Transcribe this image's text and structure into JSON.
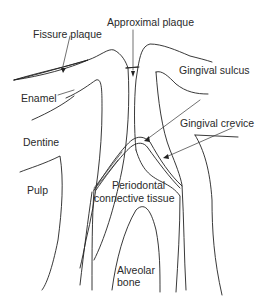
{
  "diagram": {
    "title": "",
    "labels": {
      "approximal_plaque": "Approximal plaque",
      "fissure_plaque": "Fissure plaque",
      "gingival_sulcus": "Gingival sulcus",
      "enamel": "Enamel",
      "gingival_crevice": "Gingival crevice",
      "dentine": "Dentine",
      "pulp": "Pulp",
      "periodontal_line1": "Periodontal",
      "periodontal_line2": "connective tissue",
      "alveolar_line1": "Alveolar",
      "alveolar_line2": "bone"
    },
    "colors": {
      "line": "#222222",
      "text": "#2a2a2a",
      "background": "#ffffff"
    }
  }
}
